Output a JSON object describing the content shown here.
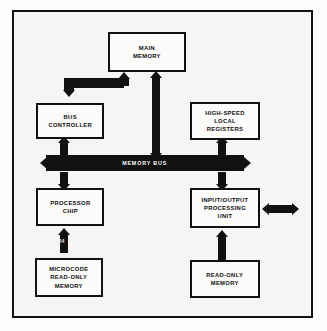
{
  "figure": {
    "background_color": "#f6f5f3",
    "ink_color": "#111111",
    "frame_color": "#141414"
  },
  "blocks": {
    "main_memory": {
      "label": "MAIN\nMEMORY"
    },
    "bus_controller": {
      "label": "BUS\nCONTROLLER"
    },
    "high_speed_registers": {
      "label": "HIGH-SPEED\nLOCAL\nREGISTERS"
    },
    "processor_chip": {
      "label": "PROCESSOR\nCHIP"
    },
    "io_processing_unit": {
      "label": "INPUT/OUTPUT\nPROCESSING\nUNIT"
    },
    "microcode_rom": {
      "label": "MICROCODE\nREAD-ONLY\nMEMORY"
    },
    "read_only_memory": {
      "label": "READ-ONLY\nMEMORY"
    }
  },
  "bus": {
    "label": "MEMORY BUS",
    "label_color": "#ffffff"
  },
  "annotations": {
    "figure_tag": "54"
  },
  "connectors": {
    "main_memory_to_bus_controller": "elbow-arrow-down-left",
    "main_memory_to_memory_bus": "double-headed-vertical-arrow",
    "bus_controller_to_memory_bus": "double-headed-vertical-arrow",
    "memory_bus_to_processor_chip": "double-headed-vertical-arrow",
    "registers_to_memory_bus": "double-headed-vertical-arrow",
    "memory_bus_to_io_unit": "double-headed-vertical-arrow",
    "microcode_rom_to_processor_chip": "arrow-up",
    "read_only_memory_to_io_unit": "arrow-up",
    "io_unit_external": "double-headed-horizontal-arrow"
  }
}
